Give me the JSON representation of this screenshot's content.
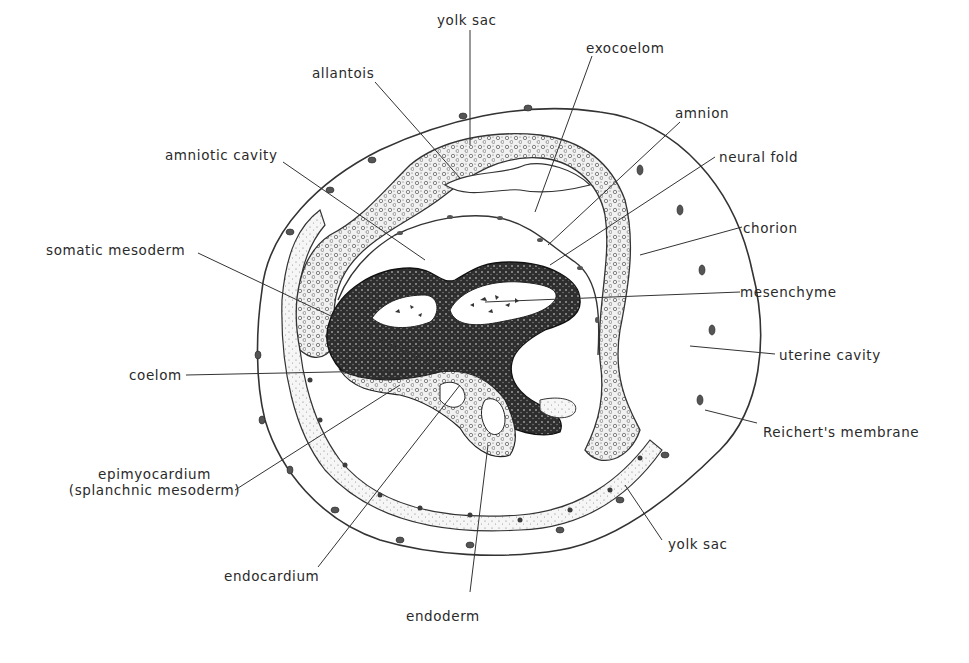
{
  "figure": {
    "type": "embryology-cross-section",
    "labels": {
      "yolk_sac_top": "yolk sac",
      "allantois": "allantois",
      "exocoelom": "exocoelom",
      "amnion": "amnion",
      "amniotic_cavity": "amniotic cavity",
      "neural_fold": "neural fold",
      "chorion": "chorion",
      "somatic_mesoderm": "somatic mesoderm",
      "mesenchyme": "mesenchyme",
      "uterine_cavity": "uterine cavity",
      "coelom": "coelom",
      "reicherts_membrane": "Reichert's membrane",
      "epimyocardium_line1": "epimyocardium",
      "epimyocardium_line2": "(splanchnic mesoderm)",
      "yolk_sac_bottom": "yolk sac",
      "endocardium": "endocardium",
      "endoderm": "endoderm"
    },
    "colors": {
      "ink": "#2a2a2a",
      "stipple_light": "#e8e8e8",
      "stipple_mid": "#bdbdbd",
      "dark_tissue": "#3a3a3a",
      "background": "#ffffff"
    }
  }
}
